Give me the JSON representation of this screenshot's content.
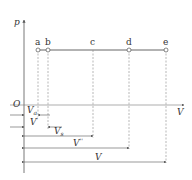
{
  "diagram": {
    "type": "p-V isobaric process diagram",
    "axes": {
      "y_label": "p",
      "x_label": "V",
      "origin_label": "O"
    },
    "points": [
      {
        "label": "a",
        "x": 38
      },
      {
        "label": "b",
        "x": 48
      },
      {
        "label": "c",
        "x": 93
      },
      {
        "label": "d",
        "x": 129
      },
      {
        "label": "e",
        "x": 166
      }
    ],
    "dimensions": {
      "va": {
        "main": "V",
        "sub": "a"
      },
      "vprime": {
        "main": "V",
        "sup": "'"
      },
      "vs": {
        "main": "V",
        "sub": "s"
      },
      "vdouble": {
        "main": "V",
        "sup": "''"
      },
      "v": {
        "main": "V"
      }
    },
    "colors": {
      "line": "#555555",
      "dash": "#888888",
      "text": "#333333"
    }
  }
}
